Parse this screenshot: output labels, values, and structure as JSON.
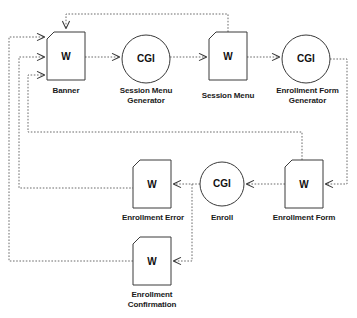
{
  "diagram": {
    "style": {
      "stroke": "#555555",
      "node_stroke": "#333333",
      "text_color": "#1a1a1a",
      "background": "#ffffff",
      "edge_style": "dotted"
    },
    "nodes": [
      {
        "id": "banner",
        "glyph": "W",
        "shape": "page",
        "label": "Banner",
        "x": 47,
        "y": 32,
        "w": 38,
        "h": 48
      },
      {
        "id": "session-menu-generator",
        "glyph": "CGI",
        "shape": "circle",
        "label": "Session Menu\nGenerator",
        "x": 122,
        "y": 35,
        "w": 48,
        "h": 48
      },
      {
        "id": "session-menu",
        "glyph": "W",
        "shape": "page",
        "label": "Session Menu",
        "x": 209,
        "y": 32,
        "w": 38,
        "h": 48
      },
      {
        "id": "enrollment-form-generator",
        "glyph": "CGI",
        "shape": "circle",
        "label": "Enrollment Form\nGenerator",
        "x": 282,
        "y": 35,
        "w": 48,
        "h": 48
      },
      {
        "id": "enrollment-error",
        "glyph": "W",
        "shape": "page",
        "label": "Enrollment Error",
        "x": 133,
        "y": 160,
        "w": 38,
        "h": 48
      },
      {
        "id": "enroll",
        "glyph": "CGI",
        "shape": "circle",
        "label": "Enroll",
        "x": 200,
        "y": 160,
        "w": 44,
        "h": 44
      },
      {
        "id": "enrollment-form",
        "glyph": "W",
        "shape": "page",
        "label": "Enrollment Form",
        "x": 285,
        "y": 160,
        "w": 38,
        "h": 48
      },
      {
        "id": "enrollment-confirmation",
        "glyph": "W",
        "shape": "page",
        "label": "Enrollment\nConfirmation",
        "x": 133,
        "y": 237,
        "w": 38,
        "h": 48
      }
    ],
    "edges": [
      {
        "id": "banner-to-session-menu-generator",
        "from": "banner",
        "to": "session-menu-generator"
      },
      {
        "id": "session-menu-generator-to-session-menu",
        "from": "session-menu-generator",
        "to": "session-menu"
      },
      {
        "id": "session-menu-to-enrollment-form-generator",
        "from": "session-menu",
        "to": "enrollment-form-generator"
      },
      {
        "id": "session-menu-to-banner-feedback",
        "from": "session-menu",
        "to": "banner"
      },
      {
        "id": "enrollment-form-generator-to-enrollment-form",
        "from": "enrollment-form-generator",
        "to": "enrollment-form"
      },
      {
        "id": "enrollment-form-to-enroll",
        "from": "enrollment-form",
        "to": "enroll"
      },
      {
        "id": "enroll-to-enrollment-error",
        "from": "enroll",
        "to": "enrollment-error"
      },
      {
        "id": "enroll-to-enrollment-confirmation",
        "from": "enroll",
        "to": "enrollment-confirmation"
      },
      {
        "id": "enrollment-form-to-banner-feedback",
        "from": "enrollment-form",
        "to": "banner"
      },
      {
        "id": "enrollment-error-to-banner-feedback",
        "from": "enrollment-error",
        "to": "banner"
      },
      {
        "id": "enrollment-confirmation-to-banner-feedback",
        "from": "enrollment-confirmation",
        "to": "banner"
      }
    ]
  }
}
